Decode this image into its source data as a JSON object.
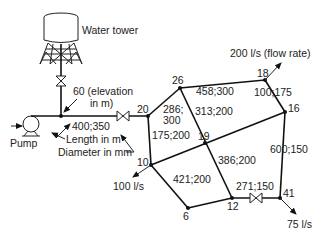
{
  "diagram": {
    "type": "pipe network",
    "labels": {
      "water_tower": "Water tower",
      "pump": "Pump",
      "elevation_line1": "60 (elevation",
      "elevation_line2": "in m)",
      "main_pipe": "400;350",
      "legend_length": "Length in m",
      "legend_diameter": "Diameter in mm"
    },
    "nodes": [
      {
        "id": "20",
        "label": "20"
      },
      {
        "id": "26",
        "label": "26"
      },
      {
        "id": "18",
        "label": "18"
      },
      {
        "id": "16",
        "label": "16"
      },
      {
        "id": "19",
        "label": "19"
      },
      {
        "id": "10",
        "label": "10"
      },
      {
        "id": "6",
        "label": "6"
      },
      {
        "id": "12",
        "label": "12"
      },
      {
        "id": "41",
        "label": "41"
      }
    ],
    "pipes": [
      {
        "from": "20",
        "to": "26",
        "label_line1": "286;",
        "label_line2": "300"
      },
      {
        "from": "26",
        "to": "18",
        "label": "458;300"
      },
      {
        "from": "26",
        "to": "12",
        "label": "313;200"
      },
      {
        "from": "18",
        "to": "16",
        "label": "100;175"
      },
      {
        "from": "20",
        "to": "10",
        "label": "175;200"
      },
      {
        "from": "10",
        "to": "16",
        "label": "19"
      },
      {
        "from": "19",
        "to": "12",
        "label": "386;200"
      },
      {
        "from": "10",
        "to": "6",
        "label": "421;200"
      },
      {
        "from": "16",
        "to": "41",
        "label": "600;150"
      },
      {
        "from": "12",
        "to": "41",
        "label": "271;150"
      }
    ],
    "demands": {
      "node18": "200 l/s (flow rate)",
      "node10": "100 l/s",
      "node41": "75 l/s"
    }
  }
}
